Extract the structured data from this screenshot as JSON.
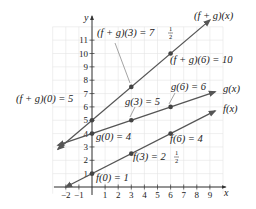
{
  "chart_data": {
    "type": "line",
    "title": "",
    "xlabel": "x",
    "ylabel": "y",
    "xlim": [
      -2.8,
      10
    ],
    "ylim": [
      -0.5,
      12.5
    ],
    "grid": true,
    "x_ticks": [
      -2,
      -1,
      1,
      2,
      3,
      4,
      5,
      6,
      7,
      8,
      9
    ],
    "x_tick_labels": [
      "−2",
      "−1",
      "1",
      "2",
      "3",
      "4",
      "5",
      "6",
      "7",
      "8",
      "9"
    ],
    "y_ticks": [
      1,
      2,
      3,
      4,
      5,
      6,
      7,
      8,
      9,
      10,
      11
    ],
    "y_tick_labels": [
      "1",
      "2",
      "3",
      "4",
      "5",
      "6",
      "7",
      "8",
      "9",
      "10",
      "11"
    ],
    "series": [
      {
        "name": "f(x)",
        "label": "f(x)",
        "equation": "f(x) = x/2 + 1",
        "x": [
          -2,
          9.4
        ],
        "y": [
          0,
          5.7
        ],
        "points": [
          {
            "x": 0,
            "y": 1,
            "label": "f(0) = 1"
          },
          {
            "x": 3,
            "y": 2.5,
            "label": "f(3) = 2½"
          },
          {
            "x": 6,
            "y": 4,
            "label": "f(6) = 4"
          }
        ]
      },
      {
        "name": "g(x)",
        "label": "g(x)",
        "equation": "g(x) = x/3 + 4",
        "x": [
          -2.6,
          9.4
        ],
        "y": [
          3.13,
          7.13
        ],
        "points": [
          {
            "x": 0,
            "y": 4,
            "label": "g(0) = 4"
          },
          {
            "x": 3,
            "y": 5,
            "label": "g(3) = 5"
          },
          {
            "x": 6,
            "y": 6,
            "label": "g(6) = 6"
          }
        ]
      },
      {
        "name": "(f + g)(x)",
        "label": "(f + g)(x)",
        "equation": "(f + g)(x) = 5x/6 + 5",
        "x": [
          -2.6,
          9.0
        ],
        "y": [
          2.83,
          12.5
        ],
        "points": [
          {
            "x": 0,
            "y": 5,
            "label": "(f + g)(0) = 5"
          },
          {
            "x": 3,
            "y": 7.5,
            "label": "(f + g)(3) = 7½"
          },
          {
            "x": 6,
            "y": 10,
            "label": "(f + g)(6) = 10"
          }
        ]
      }
    ]
  },
  "colors": {
    "line": "#555555",
    "point": "#444444",
    "grid": "#e4e4e4",
    "axis": "#333333"
  },
  "labels": {
    "fg_x": "(f + g)(x)",
    "fg_3_main": "(f + g)(3) = 7",
    "fg_3_frac_num": "1",
    "fg_3_frac_den": "2",
    "fg_6": "(f + g)(6) = 10",
    "fg_0": "(f + g)(0) = 5",
    "g_x": "g(x)",
    "g_6": "g(6) = 6",
    "g_3": "g(3) = 5",
    "g_0": "g(0) = 4",
    "f_x": "f(x)",
    "f_6": "f(6) = 4",
    "f_3_main": "f(3) = 2",
    "f_3_frac_num": "1",
    "f_3_frac_den": "2",
    "f_0": "f(0) = 1",
    "x_axis": "x",
    "y_axis": "y"
  }
}
